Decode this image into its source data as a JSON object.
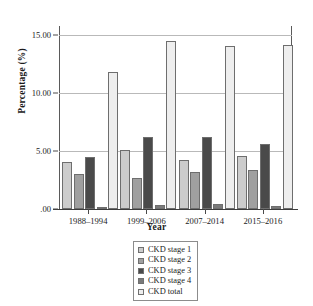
{
  "chart_data": {
    "type": "bar",
    "title": "",
    "xlabel": "Year",
    "ylabel": "Percentage (%)",
    "categories": [
      "1988–1994",
      "1999–2006",
      "2007–2014",
      "2015–2016"
    ],
    "series": [
      {
        "name": "CKD stage 1",
        "color": "#cccccc",
        "values": [
          4.1,
          5.1,
          4.2,
          4.6
        ]
      },
      {
        "name": "CKD stage 2",
        "color": "#a0a0a0",
        "values": [
          3.0,
          2.7,
          3.2,
          3.4
        ]
      },
      {
        "name": "CKD stage 3",
        "color": "#4a4a4a",
        "values": [
          4.5,
          6.2,
          6.2,
          5.6
        ]
      },
      {
        "name": "CKD stage 4",
        "color": "#7a7a7a",
        "values": [
          0.2,
          0.35,
          0.4,
          0.3
        ]
      },
      {
        "name": "CKD total",
        "color": "#eeeeee",
        "values": [
          11.8,
          14.5,
          14.1,
          14.2
        ]
      }
    ],
    "ylim": [
      0,
      15.8
    ],
    "yticks": [
      0,
      5,
      10,
      15
    ],
    "ytick_labels": [
      ".00",
      "5.00",
      "10.00",
      "15.00"
    ],
    "grid": true,
    "legend_position": "bottom-center"
  }
}
